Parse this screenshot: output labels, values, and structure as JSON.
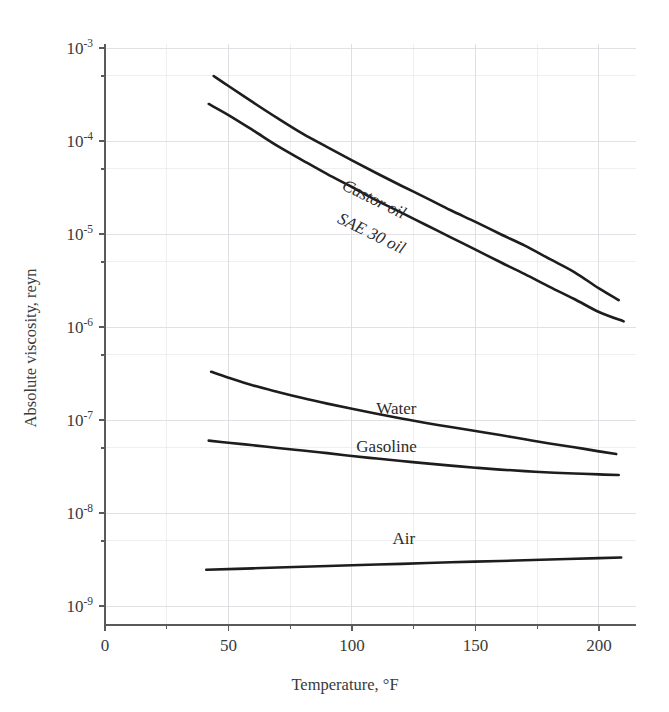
{
  "chart_data": {
    "type": "line",
    "title": "",
    "xlabel": "Temperature, °F",
    "ylabel": "Absolute viscosity, reyn",
    "xlim": [
      0,
      215
    ],
    "ylim": [
      1e-09,
      0.001
    ],
    "yscale": "log",
    "xscale": "linear",
    "grid": true,
    "legend": "inline-curve-labels",
    "xticks": [
      0,
      50,
      100,
      150,
      200
    ],
    "xtick_labels": [
      "0",
      "50",
      "100",
      "150",
      "200"
    ],
    "yticks": [
      0.001,
      0.0001,
      1e-05,
      1e-06,
      1e-07,
      1e-08,
      1e-09
    ],
    "ytick_labels": [
      "10⁻³",
      "10⁻⁴",
      "10⁻⁵",
      "10⁻⁶",
      "10⁻⁷",
      "10⁻⁸",
      "10⁻⁹"
    ],
    "ytick_bases": [
      "10",
      "10",
      "10",
      "10",
      "10",
      "10",
      "10"
    ],
    "ytick_exponents": [
      "-3",
      "-4",
      "-5",
      "-6",
      "-7",
      "-8",
      "-9"
    ],
    "series": [
      {
        "name": "Castor oil",
        "label": "Castor oil",
        "label_rotation": 26,
        "label_x": 108,
        "label_y": 2.1e-05,
        "x": [
          44,
          50,
          60,
          70,
          80,
          90,
          100,
          110,
          120,
          130,
          140,
          150,
          160,
          170,
          180,
          190,
          200,
          208
        ],
        "y": [
          0.0005,
          0.00039,
          0.00026,
          0.000175,
          0.00012,
          8.6e-05,
          6.2e-05,
          4.5e-05,
          3.3e-05,
          2.45e-05,
          1.8e-05,
          1.35e-05,
          1e-05,
          7.5e-06,
          5.4e-06,
          3.9e-06,
          2.6e-06,
          1.95e-06
        ]
      },
      {
        "name": "SAE 30 oil",
        "label": "SAE 30 oil",
        "label_rotation": 26,
        "label_x": 107,
        "label_y": 9e-06,
        "x": [
          42,
          50,
          60,
          70,
          80,
          90,
          100,
          110,
          120,
          130,
          140,
          150,
          160,
          170,
          180,
          190,
          200,
          210
        ],
        "y": [
          0.00025,
          0.00019,
          0.00013,
          8.8e-05,
          6.2e-05,
          4.4e-05,
          3.2e-05,
          2.3e-05,
          1.7e-05,
          1.25e-05,
          9.2e-06,
          6.8e-06,
          5e-06,
          3.7e-06,
          2.7e-06,
          2e-06,
          1.45e-06,
          1.15e-06
        ]
      },
      {
        "name": "Water",
        "label": "Water",
        "label_rotation": 0,
        "label_x": 118,
        "label_y": 1.15e-07,
        "x": [
          43,
          50,
          60,
          70,
          80,
          90,
          100,
          110,
          120,
          130,
          140,
          150,
          160,
          170,
          180,
          190,
          200,
          207
        ],
        "y": [
          3.3e-07,
          2.85e-07,
          2.35e-07,
          2e-07,
          1.72e-07,
          1.5e-07,
          1.32e-07,
          1.17e-07,
          1.04e-07,
          9.3e-08,
          8.4e-08,
          7.6e-08,
          6.9e-08,
          6.2e-08,
          5.6e-08,
          5.1e-08,
          4.6e-08,
          4.3e-08
        ]
      },
      {
        "name": "Gasoline",
        "label": "Gasoline",
        "label_rotation": 0,
        "label_x": 114,
        "label_y": 4.5e-08,
        "x": [
          42,
          50,
          60,
          70,
          80,
          90,
          100,
          110,
          120,
          130,
          140,
          150,
          160,
          170,
          180,
          190,
          200,
          208
        ],
        "y": [
          6e-08,
          5.7e-08,
          5.35e-08,
          5e-08,
          4.7e-08,
          4.4e-08,
          4.1e-08,
          3.85e-08,
          3.62e-08,
          3.42e-08,
          3.23e-08,
          3.07e-08,
          2.93e-08,
          2.82e-08,
          2.73e-08,
          2.66e-08,
          2.6e-08,
          2.56e-08
        ]
      },
      {
        "name": "Air",
        "label": "Air",
        "label_rotation": 0,
        "label_x": 121,
        "label_y": 4.6e-09,
        "x": [
          41,
          60,
          80,
          100,
          120,
          140,
          160,
          180,
          200,
          209
        ],
        "y": [
          2.45e-09,
          2.54e-09,
          2.64e-09,
          2.74e-09,
          2.84e-09,
          2.95e-09,
          3.05e-09,
          3.16e-09,
          3.27e-09,
          3.32e-09
        ]
      }
    ]
  },
  "axes": {
    "x_minor_step": 25,
    "y_minor_multiplier": 5
  },
  "colors": {
    "curve": "#1d1d1d",
    "grid": "#d9d9de",
    "axis": "#5a5a5a",
    "text": "#3a3a3a",
    "background": "#ffffff"
  }
}
